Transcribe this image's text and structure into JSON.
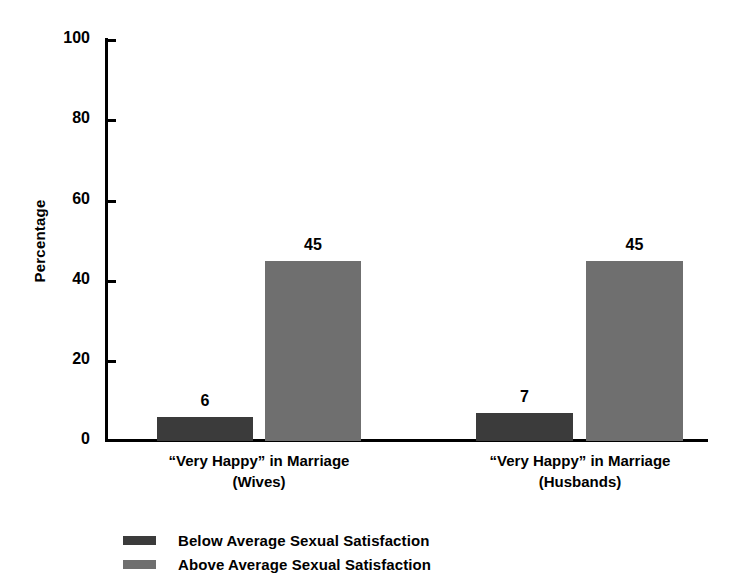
{
  "chart_data": {
    "type": "bar",
    "title": "",
    "subtitle": "",
    "xlabel": "",
    "ylabel": "Percentage",
    "ylim": [
      0,
      100
    ],
    "ytick_labels": [
      "0",
      "20",
      "40",
      "60",
      "80",
      "100"
    ],
    "ytick_values": [
      0,
      20,
      40,
      60,
      80,
      100
    ],
    "grid": false,
    "legend_position": "bottom-left",
    "categories": [
      {
        "line1": "“Very Happy” in Marriage",
        "line2": "(Wives)"
      },
      {
        "line1": "“Very Happy” in Marriage",
        "line2": "(Husbands)"
      }
    ],
    "series": [
      {
        "name": "Below Average Sexual Satisfaction",
        "color": "#3b3b3b",
        "values": [
          6,
          7
        ],
        "labels": [
          "6",
          "7"
        ]
      },
      {
        "name": "Above Average Sexual Satisfaction",
        "color": "#6f6f6f",
        "values": [
          45,
          45
        ],
        "labels": [
          "45",
          "45"
        ]
      }
    ]
  },
  "axis": {
    "y_title": "Percentage",
    "ticks": [
      {
        "label": "100",
        "value": 100
      },
      {
        "label": "80",
        "value": 80
      },
      {
        "label": "60",
        "value": 60
      },
      {
        "label": "40",
        "value": 40
      },
      {
        "label": "20",
        "value": 20
      },
      {
        "label": "0",
        "value": 0
      }
    ]
  },
  "legend": {
    "items": [
      {
        "label": "Below Average Sexual Satisfaction",
        "color": "#3b3b3b"
      },
      {
        "label": "Above Average Sexual Satisfaction",
        "color": "#6f6f6f"
      }
    ]
  }
}
